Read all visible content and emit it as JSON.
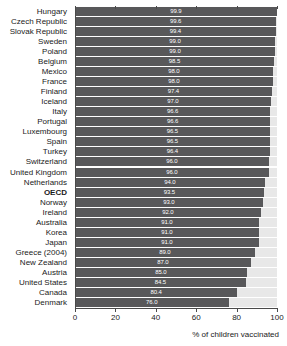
{
  "chart_data": {
    "type": "bar",
    "orientation": "horizontal",
    "title": "",
    "xlabel": "% of children vaccinated",
    "ylabel": "",
    "xlim": [
      0,
      100
    ],
    "xticks": [
      0,
      20,
      40,
      60,
      80,
      100
    ],
    "grid": false,
    "legend": null,
    "bar_color": "#58585a",
    "track_color": "#e8e8e8",
    "value_label_color": "#ffffff",
    "highlight_category": "OECD",
    "categories": [
      "Hungary",
      "Czech Republic",
      "Slovak Republic",
      "Sweden",
      "Poland",
      "Belgium",
      "Mexico",
      "France",
      "Finland",
      "Iceland",
      "Italy",
      "Portugal",
      "Luxembourg",
      "Spain",
      "Turkey",
      "Switzerland",
      "United Kingdom",
      "Netherlands",
      "OECD",
      "Norway",
      "Ireland",
      "Australia",
      "Korea",
      "Japan",
      "Greece (2004)",
      "New Zealand",
      "Austria",
      "United States",
      "Canada",
      "Denmark"
    ],
    "values": [
      99.9,
      99.6,
      99.4,
      99.0,
      99.0,
      98.5,
      98.0,
      98.0,
      97.4,
      97.0,
      96.6,
      96.6,
      96.5,
      96.5,
      96.4,
      96.0,
      96.0,
      94.0,
      93.5,
      93.0,
      92.0,
      91.0,
      91.0,
      91.0,
      89.0,
      87.0,
      85.0,
      84.5,
      80.4,
      76.0
    ],
    "value_labels": [
      "99.9",
      "99.6",
      "99.4",
      "99.0",
      "99.0",
      "98.5",
      "98.0",
      "98.0",
      "97.4",
      "97.0",
      "96.6",
      "96.6",
      "96.5",
      "96.5",
      "96.4",
      "96.0",
      "96.0",
      "94.0",
      "93.5",
      "93.0",
      "92.0",
      "91.0",
      "91.0",
      "91.0",
      "89.0",
      "87.0",
      "85.0",
      "84.5",
      "80.4",
      "76.0"
    ]
  }
}
